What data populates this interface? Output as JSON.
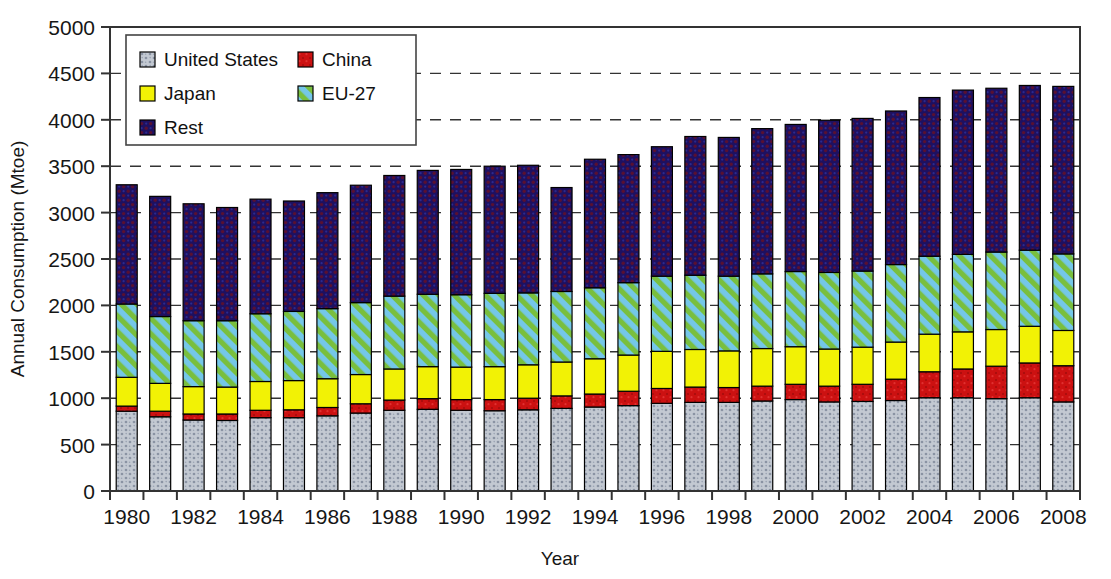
{
  "chart_data": {
    "type": "bar",
    "subtype": "stacked-bar",
    "title": "",
    "xlabel": "Year",
    "ylabel": "Annual Consumption (Mtoe)",
    "ylim": [
      0,
      5000
    ],
    "ytick_step": 500,
    "yticks": [
      0,
      500,
      1000,
      1500,
      2000,
      2500,
      3000,
      3500,
      4000,
      4500,
      5000
    ],
    "grid": "horizontal-dashed",
    "legend_position": "upper-left-inside",
    "categories": [
      1980,
      1981,
      1982,
      1983,
      1984,
      1985,
      1986,
      1987,
      1988,
      1989,
      1990,
      1991,
      1992,
      1993,
      1994,
      1995,
      1996,
      1997,
      1998,
      1999,
      2000,
      2001,
      2002,
      2003,
      2004,
      2005,
      2006,
      2007,
      2008
    ],
    "xtick_labels": [
      "1980",
      "1982",
      "1984",
      "1986",
      "1988",
      "1990",
      "1992",
      "1994",
      "1996",
      "1998",
      "2000",
      "2002",
      "2004",
      "2006",
      "2008"
    ],
    "series": [
      {
        "name": "United States",
        "color": "#b9bfc9",
        "pattern": "dots",
        "values": [
          860,
          800,
          765,
          760,
          790,
          790,
          810,
          840,
          870,
          880,
          870,
          865,
          875,
          890,
          905,
          920,
          945,
          955,
          955,
          970,
          985,
          960,
          965,
          975,
          1005,
          1005,
          995,
          1005,
          960
        ]
      },
      {
        "name": "China",
        "color": "#cc1111",
        "pattern": "solid",
        "values": [
          55,
          60,
          65,
          70,
          80,
          85,
          90,
          100,
          110,
          115,
          115,
          120,
          125,
          135,
          140,
          155,
          160,
          165,
          160,
          160,
          165,
          170,
          185,
          230,
          280,
          310,
          350,
          375,
          390
        ]
      },
      {
        "name": "Japan",
        "color": "#f2f205",
        "pattern": "solid",
        "values": [
          310,
          300,
          295,
          290,
          310,
          315,
          310,
          315,
          335,
          345,
          350,
          355,
          360,
          365,
          380,
          390,
          400,
          405,
          395,
          405,
          405,
          400,
          400,
          400,
          405,
          400,
          395,
          395,
          380
        ]
      },
      {
        "name": "EU-27",
        "color": "#74c7e8",
        "pattern": "diagonal-stripes-green",
        "values": [
          790,
          720,
          710,
          715,
          730,
          745,
          755,
          775,
          785,
          780,
          780,
          790,
          775,
          760,
          765,
          780,
          810,
          800,
          805,
          805,
          810,
          825,
          820,
          835,
          840,
          835,
          835,
          820,
          825
        ]
      },
      {
        "name": "Rest",
        "color": "#1e1060",
        "pattern": "texture-dark",
        "values": [
          1285,
          1295,
          1260,
          1220,
          1235,
          1190,
          1250,
          1265,
          1300,
          1335,
          1350,
          1370,
          1375,
          1120,
          1385,
          1380,
          1395,
          1495,
          1495,
          1565,
          1585,
          1640,
          1645,
          1655,
          1710,
          1770,
          1765,
          1775,
          1805
        ]
      }
    ],
    "totals": [
      3300,
      3175,
      3095,
      3055,
      3145,
      3125,
      3215,
      3295,
      3400,
      3455,
      3465,
      3500,
      3510,
      3270,
      3575,
      3625,
      3710,
      3820,
      3810,
      3905,
      3950,
      3995,
      4015,
      4095,
      4240,
      4320,
      4340,
      4370,
      4360
    ]
  },
  "legend": {
    "items": [
      {
        "label": "United States",
        "color": "#b9bfc9"
      },
      {
        "label": "China",
        "color": "#cc1111"
      },
      {
        "label": "Japan",
        "color": "#f2f205"
      },
      {
        "label": "EU-27",
        "color": "#74c7e8"
      },
      {
        "label": "Rest",
        "color": "#1e1060"
      }
    ]
  },
  "axes": {
    "y_title": "Annual Consumption (Mtoe)",
    "x_title": "Year"
  }
}
